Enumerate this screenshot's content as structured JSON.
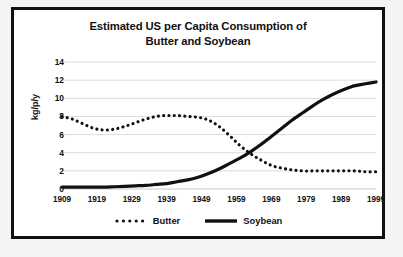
{
  "chart_data": {
    "type": "line",
    "title": "Estimated US per Capita Consumption of Butter and Soybean",
    "title_line1": "Estimated US per Capita Consumption of",
    "title_line2": "Butter and Soybean",
    "xlabel": "",
    "ylabel": "kg/p/y",
    "ylim": [
      0,
      14
    ],
    "xlim": [
      1909,
      1999
    ],
    "ytick_labels": [
      "0",
      "2",
      "4",
      "6",
      "8",
      "10",
      "12",
      "14"
    ],
    "ytick_values": [
      0,
      2,
      4,
      6,
      8,
      10,
      12,
      14
    ],
    "xtick_labels": [
      "1909",
      "1919",
      "1929",
      "1939",
      "1949",
      "1959",
      "1969",
      "1979",
      "1989",
      "1999"
    ],
    "xtick_values": [
      1909,
      1919,
      1929,
      1939,
      1949,
      1959,
      1969,
      1979,
      1989,
      1999
    ],
    "grid": "horizontal",
    "legend_position": "bottom-center",
    "x": [
      1909,
      1912,
      1915,
      1918,
      1921,
      1924,
      1927,
      1930,
      1933,
      1936,
      1939,
      1942,
      1945,
      1948,
      1951,
      1954,
      1957,
      1960,
      1963,
      1966,
      1969,
      1972,
      1975,
      1978,
      1981,
      1984,
      1987,
      1990,
      1993,
      1996,
      1999
    ],
    "series": [
      {
        "name": "Butter",
        "style": "dotted",
        "color": "#111111",
        "values": [
          8.0,
          7.7,
          7.2,
          6.7,
          6.5,
          6.6,
          6.9,
          7.3,
          7.7,
          8.0,
          8.1,
          8.1,
          8.0,
          7.9,
          7.6,
          6.9,
          5.9,
          4.8,
          3.9,
          3.2,
          2.6,
          2.3,
          2.1,
          2.0,
          2.0,
          2.0,
          2.0,
          2.0,
          2.0,
          1.9,
          1.9
        ]
      },
      {
        "name": "Soybean",
        "style": "solid",
        "color": "#111111",
        "values": [
          0.2,
          0.2,
          0.2,
          0.2,
          0.2,
          0.25,
          0.3,
          0.35,
          0.4,
          0.5,
          0.6,
          0.8,
          1.0,
          1.3,
          1.7,
          2.2,
          2.8,
          3.4,
          4.1,
          4.9,
          5.8,
          6.7,
          7.6,
          8.4,
          9.2,
          9.9,
          10.5,
          11.0,
          11.4,
          11.6,
          11.8
        ]
      }
    ],
    "legend": [
      {
        "label": "Butter",
        "style": "dotted"
      },
      {
        "label": "Soybean",
        "style": "solid"
      }
    ]
  }
}
